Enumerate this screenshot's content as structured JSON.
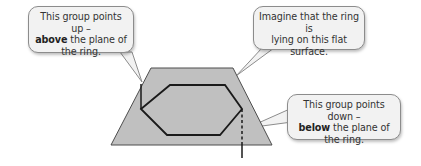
{
  "callouts": {
    "up": {
      "line1": "This group points up –",
      "bold": "above",
      "line2_rest": " the plane of",
      "line3": "the ring."
    },
    "surface": {
      "line1": "Imagine that the ring is",
      "line2": "lying on this flat",
      "line3": "surface."
    },
    "down": {
      "line1": "This group points down –",
      "bold": "below",
      "line2_rest": " the plane of",
      "line3": "the ring."
    }
  },
  "colors": {
    "plane_fill": "#c0c0c0",
    "outline": "#1a1a1a",
    "callout_fill": "#f2f2f2",
    "callout_border": "#8c8c8c"
  }
}
